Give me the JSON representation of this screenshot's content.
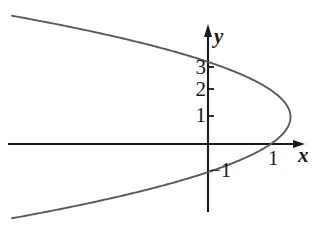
{
  "figure": {
    "kind": "cartesian-plot",
    "background_color": "#ffffff",
    "ink_color": "#1a1a1a",
    "curve_color": "#555555"
  },
  "axes": {
    "x_axis_name": "x",
    "y_axis_name": "y",
    "x_tick_labels": [
      "1"
    ],
    "y_tick_labels": [
      "3",
      "2",
      "1",
      "-1"
    ],
    "origin_px": {
      "x": 208,
      "y": 144
    },
    "unit_px": {
      "x": 66,
      "y": 27
    },
    "xlim": [
      -3.1,
      1.6
    ],
    "ylim": [
      -2.4,
      4.3
    ],
    "grid": false,
    "arrows": [
      "x-positive",
      "y-positive"
    ]
  },
  "labels": {
    "y3": "3",
    "y2": "2",
    "y1": "1",
    "y_neg1": "−1",
    "x1": "1",
    "axis_x": "x",
    "axis_y": "y"
  },
  "chart_data": {
    "type": "line",
    "title": "",
    "xlabel": "x",
    "ylabel": "y",
    "grid": false,
    "legend": "none",
    "xlim": [
      -3.1,
      1.6
    ],
    "ylim": [
      -2.4,
      4.3
    ],
    "xticks": [
      1
    ],
    "xticklabels": [
      "1"
    ],
    "yticks": [
      3,
      2,
      1,
      -1
    ],
    "yticklabels": [
      "3",
      "2",
      "1",
      "-1"
    ],
    "series": [
      {
        "name": "leftward-parabola",
        "equation": "x = 1.25 - 0.3(y - 1)^2",
        "orientation": "opens-left",
        "vertex": [
          1.25,
          1
        ],
        "x_intercepts": [
          1
        ],
        "y_intercepts": [
          3,
          -1
        ],
        "x": [
          -2.85,
          -2.55,
          -2.2,
          -1.85,
          -1.5,
          -1.15,
          -0.8,
          -0.45,
          -0.1,
          0.25,
          0.55,
          0.8,
          1.0,
          1.15,
          1.22,
          1.25,
          1.22,
          1.15,
          1.0,
          0.8,
          0.55,
          0.25,
          -0.1,
          -0.45,
          -0.8,
          -1.15,
          -1.5,
          -1.85,
          -2.2,
          -2.55,
          -2.85
        ],
        "y": [
          4.7,
          4.5,
          4.3,
          4.1,
          3.9,
          3.7,
          3.5,
          3.3,
          3.1,
          2.8,
          2.5,
          2.2,
          2.0,
          1.6,
          1.3,
          1.0,
          0.7,
          0.4,
          0.0,
          -0.2,
          -0.5,
          -0.8,
          -1.1,
          -1.3,
          -1.5,
          -1.7,
          -1.9,
          -2.1,
          -2.3,
          -2.5,
          -2.7
        ]
      }
    ]
  }
}
